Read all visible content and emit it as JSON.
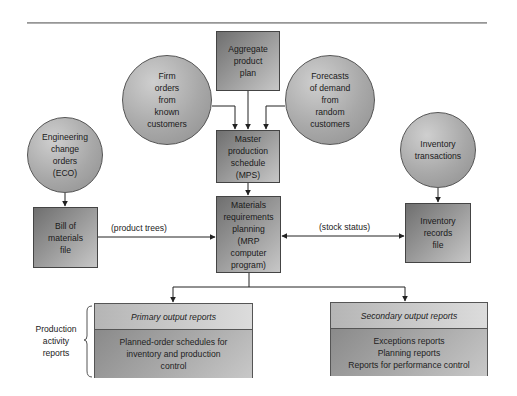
{
  "diagram": {
    "type": "flowchart",
    "title": "",
    "nodes": {
      "aggregate": {
        "shape": "box",
        "lines": [
          "Aggregate",
          "product",
          "plan"
        ]
      },
      "firm_orders": {
        "shape": "circle",
        "lines": [
          "Firm",
          "orders",
          "from",
          "known",
          "customers"
        ]
      },
      "forecasts": {
        "shape": "circle",
        "lines": [
          "Forecasts",
          "of demand",
          "from",
          "random",
          "customers"
        ]
      },
      "mps": {
        "shape": "box",
        "lines": [
          "Master",
          "production",
          "schedule",
          "(MPS)"
        ]
      },
      "eco": {
        "shape": "circle",
        "lines": [
          "Engineering",
          "change",
          "orders",
          "(ECO)"
        ]
      },
      "inv_transactions": {
        "shape": "circle",
        "lines": [
          "Inventory",
          "transactions"
        ]
      },
      "bom": {
        "shape": "box",
        "lines": [
          "Bill of",
          "materials",
          "file"
        ]
      },
      "mrp": {
        "shape": "box",
        "lines": [
          "Materials",
          "requirements",
          "planning",
          "(MRP",
          "computer",
          "program)"
        ]
      },
      "inv_records": {
        "shape": "box",
        "lines": [
          "Inventory",
          "records",
          "file"
        ]
      },
      "primary": {
        "shape": "report-box",
        "header": "Primary output reports",
        "lines": [
          "Planned-order schedules for",
          "inventory and production",
          "control"
        ]
      },
      "secondary": {
        "shape": "report-box",
        "header": "Secondary output reports",
        "lines": [
          "Exceptions reports",
          "Planning reports",
          "Reports for performance control"
        ]
      }
    },
    "edge_labels": {
      "product_trees": "(product trees)",
      "stock_status": "(stock status)"
    },
    "side_label": {
      "lines": [
        "Production",
        "activity",
        "reports"
      ]
    },
    "edges": [
      {
        "from": "aggregate",
        "to": "mps"
      },
      {
        "from": "firm_orders",
        "to": "mps"
      },
      {
        "from": "forecasts",
        "to": "mps"
      },
      {
        "from": "mps",
        "to": "mrp"
      },
      {
        "from": "eco",
        "to": "bom"
      },
      {
        "from": "inv_transactions",
        "to": "inv_records"
      },
      {
        "from": "bom",
        "to": "mrp",
        "label": "(product trees)"
      },
      {
        "from": "mrp",
        "to": "inv_records",
        "label": "(stock status)",
        "bidirectional": true
      },
      {
        "from": "mrp",
        "to": "primary"
      },
      {
        "from": "mrp",
        "to": "secondary"
      }
    ],
    "colors": {
      "box_dark": "#6f6f6f",
      "box_light": "#c7c7c7",
      "circle": "#a8a8a8",
      "line": "#222222"
    }
  }
}
